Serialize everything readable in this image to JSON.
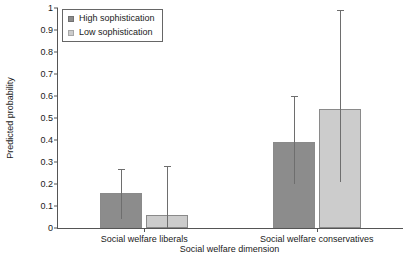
{
  "chart_data": {
    "type": "bar",
    "title": "",
    "xlabel": "Social welfare dimension",
    "ylabel": "Predicted probability",
    "categories": [
      "Social welfare liberals",
      "Social welfare conservatives"
    ],
    "ylim": [
      0,
      1
    ],
    "yticks": [
      "0",
      "0.1",
      "0.2",
      "0.3",
      "0.4",
      "0.5",
      "0.6",
      "0.7",
      "0.8",
      "0.9",
      "1"
    ],
    "ytick_values": [
      0,
      0.1,
      0.2,
      0.3,
      0.4,
      0.5,
      0.6,
      0.7,
      0.8,
      0.9,
      1
    ],
    "grid": false,
    "legend_position": "top-left",
    "series": [
      {
        "name": "High sophistication",
        "color": "#8c8c8c",
        "values": [
          0.16,
          0.39
        ],
        "error_low": [
          0.04,
          0.2
        ],
        "error_high": [
          0.27,
          0.6
        ]
      },
      {
        "name": "Low sophistication",
        "color": "#cccccc",
        "values": [
          0.06,
          0.54
        ],
        "error_low": [
          0.0,
          0.21
        ],
        "error_high": [
          0.28,
          0.99
        ]
      }
    ]
  },
  "legend": {
    "items": [
      {
        "label": "High sophistication",
        "color": "#8c8c8c"
      },
      {
        "label": "Low sophistication",
        "color": "#cccccc"
      }
    ]
  }
}
